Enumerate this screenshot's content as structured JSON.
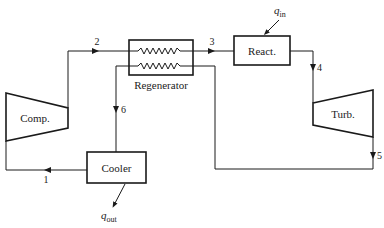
{
  "colors": {
    "line": "#1a1a1a",
    "background": "#ffffff",
    "text": "#222222"
  },
  "components": {
    "compressor": {
      "label": "Comp."
    },
    "regenerator": {
      "label": "Regenerator"
    },
    "reactor": {
      "label": "React."
    },
    "turbine": {
      "label": "Turb."
    },
    "cooler": {
      "label": "Cooler"
    }
  },
  "states": {
    "s1": "1",
    "s2": "2",
    "s3": "3",
    "s4": "4",
    "s5": "5",
    "s6": "6"
  },
  "heat": {
    "q_in": {
      "symbol": "q",
      "subscript": "in"
    },
    "q_out": {
      "symbol": "q",
      "subscript": "out"
    }
  }
}
